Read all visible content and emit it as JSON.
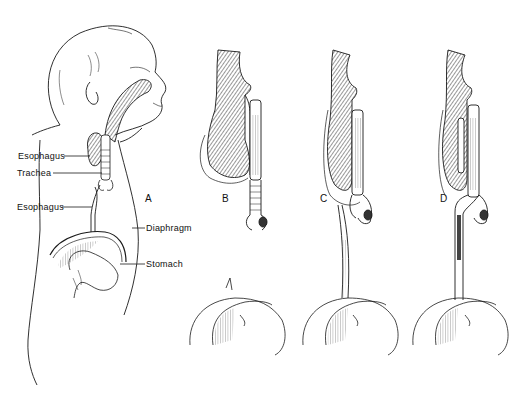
{
  "figure": {
    "colors": {
      "ink": "#1a1a1a",
      "hatch": "#555555",
      "paper": "#ffffff"
    }
  },
  "labels": {
    "esophagus_upper": "Esophagus",
    "trachea": "Trachea",
    "esophagus_lower": "Esophagus",
    "diaphragm": "Diaphragm",
    "stomach": "Stomach"
  },
  "panels": [
    {
      "id": "A",
      "label": "A"
    },
    {
      "id": "B",
      "label": "B"
    },
    {
      "id": "C",
      "label": "C"
    },
    {
      "id": "D",
      "label": "D"
    }
  ]
}
